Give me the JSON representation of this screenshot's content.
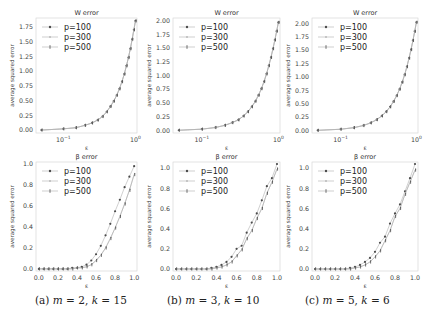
{
  "figure": {
    "captions": [
      "(a) m = 2, k = 15",
      "(b) m = 3, k = 10",
      "(c) m = 5, k = 6"
    ],
    "caption_parts": [
      {
        "label": "(a)",
        "m": "2",
        "k": "15"
      },
      {
        "label": "(b)",
        "m": "3",
        "k": "10"
      },
      {
        "label": "(c)",
        "m": "5",
        "k": "6"
      }
    ]
  },
  "chart_data": [
    {
      "type": "line",
      "title": "W error",
      "xlabel": "ε",
      "ylabel": "average squared error",
      "xscale": "log",
      "xticks": [
        "10^-1",
        "10^0"
      ],
      "yticks": [
        "0.00",
        "0.25",
        "0.50",
        "0.75",
        "1.00",
        "1.25",
        "1.50",
        "1.75"
      ],
      "ylim": [
        -0.05,
        1.9
      ],
      "legend": [
        "p=100",
        "p=300",
        "p=500"
      ],
      "legend_position": "upper left",
      "x": [
        0.05,
        0.1,
        0.15,
        0.2,
        0.25,
        0.3,
        0.35,
        0.4,
        0.45,
        0.5,
        0.55,
        0.6,
        0.65,
        0.7,
        0.75,
        0.8,
        0.85,
        0.9,
        0.95,
        1.0
      ],
      "series": [
        {
          "name": "p=100",
          "values": [
            0.0,
            0.02,
            0.04,
            0.08,
            0.12,
            0.17,
            0.23,
            0.31,
            0.4,
            0.49,
            0.59,
            0.7,
            0.82,
            0.95,
            1.09,
            1.23,
            1.38,
            1.54,
            1.7,
            1.85
          ]
        },
        {
          "name": "p=300",
          "values": [
            0.0,
            0.02,
            0.04,
            0.08,
            0.12,
            0.17,
            0.23,
            0.31,
            0.4,
            0.49,
            0.59,
            0.7,
            0.82,
            0.95,
            1.09,
            1.23,
            1.38,
            1.54,
            1.7,
            1.85
          ]
        },
        {
          "name": "p=500",
          "values": [
            0.0,
            0.02,
            0.04,
            0.08,
            0.12,
            0.17,
            0.23,
            0.31,
            0.4,
            0.49,
            0.59,
            0.7,
            0.82,
            0.95,
            1.09,
            1.23,
            1.38,
            1.54,
            1.7,
            1.85
          ]
        }
      ]
    },
    {
      "type": "line",
      "title": "W error",
      "xlabel": "ε",
      "ylabel": "average squared error",
      "xscale": "log",
      "xticks": [
        "10^-1",
        "10^0"
      ],
      "yticks": [
        "0.00",
        "0.25",
        "0.50",
        "0.75",
        "1.00",
        "1.25",
        "1.50",
        "1.75",
        "2.00"
      ],
      "ylim": [
        -0.05,
        2.05
      ],
      "legend": [
        "p=100",
        "p=300",
        "p=500"
      ],
      "legend_position": "upper left",
      "x": [
        0.05,
        0.1,
        0.15,
        0.2,
        0.25,
        0.3,
        0.35,
        0.4,
        0.45,
        0.5,
        0.55,
        0.6,
        0.65,
        0.7,
        0.75,
        0.8,
        0.85,
        0.9,
        0.95,
        1.0
      ],
      "series": [
        {
          "name": "p=100",
          "values": [
            0.0,
            0.02,
            0.05,
            0.09,
            0.14,
            0.19,
            0.26,
            0.34,
            0.43,
            0.53,
            0.64,
            0.76,
            0.89,
            1.03,
            1.18,
            1.33,
            1.49,
            1.65,
            1.81,
            1.97
          ]
        },
        {
          "name": "p=300",
          "values": [
            0.0,
            0.02,
            0.05,
            0.09,
            0.14,
            0.19,
            0.26,
            0.34,
            0.43,
            0.53,
            0.64,
            0.76,
            0.89,
            1.03,
            1.18,
            1.33,
            1.49,
            1.65,
            1.81,
            1.97
          ]
        },
        {
          "name": "p=500",
          "values": [
            0.0,
            0.02,
            0.05,
            0.09,
            0.14,
            0.19,
            0.26,
            0.34,
            0.43,
            0.53,
            0.64,
            0.76,
            0.89,
            1.03,
            1.18,
            1.33,
            1.49,
            1.65,
            1.81,
            1.97
          ]
        }
      ]
    },
    {
      "type": "line",
      "title": "W error",
      "xlabel": "ε",
      "ylabel": "average squared error",
      "xscale": "log",
      "xticks": [
        "10^-1",
        "10^0"
      ],
      "yticks": [
        "0.00",
        "0.25",
        "0.50",
        "0.75",
        "1.00",
        "1.25",
        "1.50",
        "1.75",
        "2.00"
      ],
      "ylim": [
        -0.05,
        2.1
      ],
      "legend": [
        "p=100",
        "p=300",
        "p=500"
      ],
      "legend_position": "upper left",
      "x": [
        0.05,
        0.1,
        0.15,
        0.2,
        0.25,
        0.3,
        0.35,
        0.4,
        0.45,
        0.5,
        0.55,
        0.6,
        0.65,
        0.7,
        0.75,
        0.8,
        0.85,
        0.9,
        0.95,
        1.0
      ],
      "series": [
        {
          "name": "p=100",
          "values": [
            0.0,
            0.02,
            0.05,
            0.09,
            0.14,
            0.2,
            0.27,
            0.35,
            0.44,
            0.54,
            0.65,
            0.77,
            0.9,
            1.04,
            1.19,
            1.35,
            1.51,
            1.68,
            1.85,
            2.02
          ]
        },
        {
          "name": "p=300",
          "values": [
            0.0,
            0.02,
            0.05,
            0.09,
            0.14,
            0.2,
            0.27,
            0.35,
            0.44,
            0.54,
            0.65,
            0.77,
            0.9,
            1.04,
            1.19,
            1.35,
            1.51,
            1.68,
            1.85,
            2.02
          ]
        },
        {
          "name": "p=500",
          "values": [
            0.0,
            0.02,
            0.05,
            0.09,
            0.14,
            0.2,
            0.27,
            0.35,
            0.44,
            0.54,
            0.65,
            0.77,
            0.9,
            1.04,
            1.19,
            1.35,
            1.51,
            1.68,
            1.85,
            2.02
          ]
        }
      ]
    },
    {
      "type": "line",
      "title": "β error",
      "xlabel": "ε",
      "ylabel": "average squared error",
      "xticks": [
        "0.0",
        "0.2",
        "0.4",
        "0.6",
        "0.8",
        "1.0"
      ],
      "yticks": [
        "0.0",
        "0.2",
        "0.4",
        "0.6",
        "0.8",
        "1.0"
      ],
      "xlim": [
        -0.03,
        1.03
      ],
      "ylim": [
        -0.02,
        1.02
      ],
      "legend": [
        "p=100",
        "p=300",
        "p=500"
      ],
      "legend_position": "upper left",
      "x": [
        0.0,
        0.05,
        0.1,
        0.15,
        0.2,
        0.25,
        0.3,
        0.35,
        0.4,
        0.45,
        0.5,
        0.55,
        0.6,
        0.65,
        0.7,
        0.75,
        0.8,
        0.85,
        0.9,
        0.95,
        1.0
      ],
      "series": [
        {
          "name": "p=100",
          "values": [
            0.0,
            0.0,
            0.0,
            0.0,
            0.0,
            0.0,
            0.0,
            0.01,
            0.01,
            0.02,
            0.04,
            0.08,
            0.14,
            0.22,
            0.32,
            0.43,
            0.55,
            0.66,
            0.78,
            0.88,
            0.98
          ]
        },
        {
          "name": "p=300",
          "values": [
            0.0,
            0.0,
            0.0,
            0.0,
            0.0,
            0.0,
            0.0,
            0.0,
            0.01,
            0.01,
            0.02,
            0.04,
            0.08,
            0.13,
            0.2,
            0.29,
            0.39,
            0.5,
            0.62,
            0.75,
            0.9
          ]
        },
        {
          "name": "p=500",
          "values": [
            0.0,
            0.0,
            0.0,
            0.0,
            0.0,
            0.0,
            0.0,
            0.0,
            0.01,
            0.01,
            0.02,
            0.04,
            0.08,
            0.13,
            0.2,
            0.29,
            0.39,
            0.5,
            0.62,
            0.75,
            0.9
          ]
        }
      ]
    },
    {
      "type": "line",
      "title": "β error",
      "xlabel": "ε",
      "ylabel": "average squared error",
      "xticks": [
        "0.0",
        "0.2",
        "0.4",
        "0.6",
        "0.8",
        "1.0"
      ],
      "yticks": [
        "0.0",
        "0.2",
        "0.4",
        "0.6",
        "0.8",
        "1.0"
      ],
      "xlim": [
        -0.03,
        1.03
      ],
      "ylim": [
        -0.02,
        1.06
      ],
      "legend": [
        "p=100",
        "p=300",
        "p=500"
      ],
      "legend_position": "upper left",
      "x": [
        0.0,
        0.05,
        0.1,
        0.15,
        0.2,
        0.25,
        0.3,
        0.35,
        0.4,
        0.45,
        0.5,
        0.55,
        0.6,
        0.65,
        0.7,
        0.75,
        0.8,
        0.85,
        0.9,
        0.95,
        1.0
      ],
      "series": [
        {
          "name": "p=100",
          "values": [
            0.0,
            0.0,
            0.0,
            0.0,
            0.0,
            0.0,
            0.0,
            0.01,
            0.02,
            0.04,
            0.07,
            0.12,
            0.2,
            0.23,
            0.36,
            0.46,
            0.55,
            0.68,
            0.82,
            0.9,
            1.04
          ]
        },
        {
          "name": "p=300",
          "values": [
            0.0,
            0.0,
            0.0,
            0.0,
            0.0,
            0.0,
            0.0,
            0.0,
            0.01,
            0.02,
            0.04,
            0.07,
            0.13,
            0.19,
            0.3,
            0.38,
            0.5,
            0.6,
            0.75,
            0.86,
            0.99
          ]
        },
        {
          "name": "p=500",
          "values": [
            0.0,
            0.0,
            0.0,
            0.0,
            0.0,
            0.0,
            0.0,
            0.0,
            0.01,
            0.02,
            0.04,
            0.07,
            0.13,
            0.19,
            0.3,
            0.38,
            0.5,
            0.6,
            0.75,
            0.86,
            0.99
          ]
        }
      ]
    },
    {
      "type": "line",
      "title": "β error",
      "xlabel": "ε",
      "ylabel": "average squared error",
      "xticks": [
        "0.0",
        "0.2",
        "0.4",
        "0.6",
        "0.8",
        "1.0"
      ],
      "yticks": [
        "0.0",
        "0.2",
        "0.4",
        "0.6",
        "0.8",
        "1.0"
      ],
      "xlim": [
        -0.03,
        1.03
      ],
      "ylim": [
        -0.02,
        1.06
      ],
      "legend": [
        "p=100",
        "p=300",
        "p=500"
      ],
      "legend_position": "upper left",
      "x": [
        0.0,
        0.05,
        0.1,
        0.15,
        0.2,
        0.25,
        0.3,
        0.35,
        0.4,
        0.45,
        0.5,
        0.55,
        0.6,
        0.65,
        0.7,
        0.75,
        0.8,
        0.85,
        0.9,
        0.95,
        1.0
      ],
      "series": [
        {
          "name": "p=100",
          "values": [
            0.0,
            0.0,
            0.0,
            0.0,
            0.0,
            0.0,
            0.0,
            0.01,
            0.02,
            0.04,
            0.07,
            0.11,
            0.17,
            0.26,
            0.32,
            0.45,
            0.55,
            0.64,
            0.77,
            0.9,
            1.04
          ]
        },
        {
          "name": "p=300",
          "values": [
            0.0,
            0.0,
            0.0,
            0.0,
            0.0,
            0.0,
            0.0,
            0.0,
            0.01,
            0.02,
            0.04,
            0.07,
            0.12,
            0.18,
            0.28,
            0.38,
            0.52,
            0.6,
            0.74,
            0.86,
            0.98
          ]
        },
        {
          "name": "p=500",
          "values": [
            0.0,
            0.0,
            0.0,
            0.0,
            0.0,
            0.0,
            0.0,
            0.0,
            0.01,
            0.02,
            0.04,
            0.07,
            0.12,
            0.18,
            0.28,
            0.38,
            0.52,
            0.6,
            0.74,
            0.86,
            0.98
          ]
        }
      ]
    }
  ],
  "style": {
    "line_color": "#b0b0b0",
    "marker_color": "#4a4a4a",
    "marker_light": "#8a8a8a",
    "frame_color": "#d8d8d8",
    "text_color": "#333333"
  }
}
